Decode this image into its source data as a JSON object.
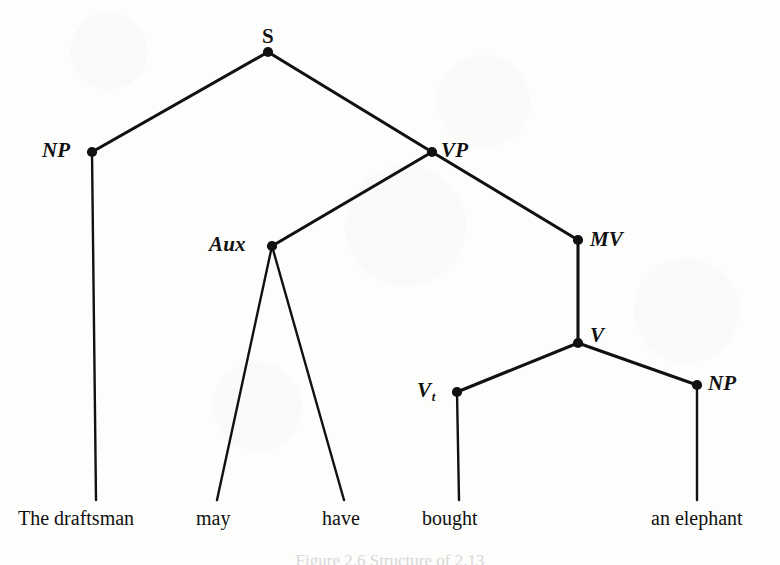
{
  "figure": {
    "type": "constituency-syntax-tree",
    "sentence": "The draftsman may have bought an elephant",
    "caption": "Figure 2.6  Structure of 2.13",
    "ink_color": "#111111",
    "background_color": "#fdfdfc"
  },
  "nodes": [
    {
      "id": "S",
      "label": "S",
      "subscript": "",
      "italic": false,
      "x": 268,
      "y": 52,
      "label_x": 262,
      "label_y": 26,
      "label_align": "above"
    },
    {
      "id": "NP1",
      "label": "NP",
      "subscript": "",
      "italic": true,
      "x": 92,
      "y": 152,
      "label_x": 42,
      "label_y": 140,
      "label_align": "left"
    },
    {
      "id": "VP",
      "label": "VP",
      "subscript": "",
      "italic": true,
      "x": 432,
      "y": 152,
      "label_x": 441,
      "label_y": 140,
      "label_align": "right"
    },
    {
      "id": "Aux",
      "label": "Aux",
      "subscript": "",
      "italic": true,
      "x": 272,
      "y": 246,
      "label_x": 209,
      "label_y": 234,
      "label_align": "left"
    },
    {
      "id": "MV",
      "label": "MV",
      "subscript": "",
      "italic": true,
      "x": 578,
      "y": 240,
      "label_x": 590,
      "label_y": 229,
      "label_align": "right"
    },
    {
      "id": "V",
      "label": "V",
      "subscript": "",
      "italic": true,
      "x": 578,
      "y": 343,
      "label_x": 590,
      "label_y": 325,
      "label_align": "right"
    },
    {
      "id": "Vt",
      "label": "V",
      "subscript": "t",
      "italic": true,
      "x": 457,
      "y": 392,
      "label_x": 417,
      "label_y": 380,
      "label_align": "left"
    },
    {
      "id": "NP2",
      "label": "NP",
      "subscript": "",
      "italic": true,
      "x": 697,
      "y": 385,
      "label_x": 708,
      "label_y": 373,
      "label_align": "right"
    }
  ],
  "edges": [
    {
      "from": "S",
      "to": "NP1",
      "x1": 268,
      "y1": 52,
      "x2": 92,
      "y2": 152
    },
    {
      "from": "S",
      "to": "VP",
      "x1": 268,
      "y1": 52,
      "x2": 432,
      "y2": 152
    },
    {
      "from": "VP",
      "to": "Aux",
      "x1": 432,
      "y1": 152,
      "x2": 272,
      "y2": 246
    },
    {
      "from": "VP",
      "to": "MV",
      "x1": 432,
      "y1": 152,
      "x2": 578,
      "y2": 240
    },
    {
      "from": "MV",
      "to": "V",
      "x1": 578,
      "y1": 240,
      "x2": 578,
      "y2": 343
    },
    {
      "from": "V",
      "to": "Vt",
      "x1": 578,
      "y1": 343,
      "x2": 457,
      "y2": 392
    },
    {
      "from": "V",
      "to": "NP2",
      "x1": 578,
      "y1": 343,
      "x2": 697,
      "y2": 385
    },
    {
      "from": "NP1",
      "to": "w1",
      "x1": 92,
      "y1": 152,
      "x2": 96,
      "y2": 500
    },
    {
      "from": "Aux",
      "to": "w2",
      "x1": 272,
      "y1": 246,
      "x2": 217,
      "y2": 500
    },
    {
      "from": "Aux",
      "to": "w3",
      "x1": 272,
      "y1": 246,
      "x2": 344,
      "y2": 500
    },
    {
      "from": "Vt",
      "to": "w4",
      "x1": 457,
      "y1": 392,
      "x2": 459,
      "y2": 500
    },
    {
      "from": "NP2",
      "to": "w5",
      "x1": 697,
      "y1": 385,
      "x2": 697,
      "y2": 500
    }
  ],
  "terminals": [
    {
      "id": "w1",
      "text": "The draftsman",
      "x": 18,
      "y": 508,
      "parent": "NP1"
    },
    {
      "id": "w2",
      "text": "may",
      "x": 196,
      "y": 508,
      "parent": "Aux"
    },
    {
      "id": "w3",
      "text": "have",
      "x": 322,
      "y": 508,
      "parent": "Aux"
    },
    {
      "id": "w4",
      "text": "bought",
      "x": 422,
      "y": 508,
      "parent": "Vt"
    },
    {
      "id": "w5",
      "text": "an elephant",
      "x": 651,
      "y": 508,
      "parent": "NP2"
    }
  ]
}
